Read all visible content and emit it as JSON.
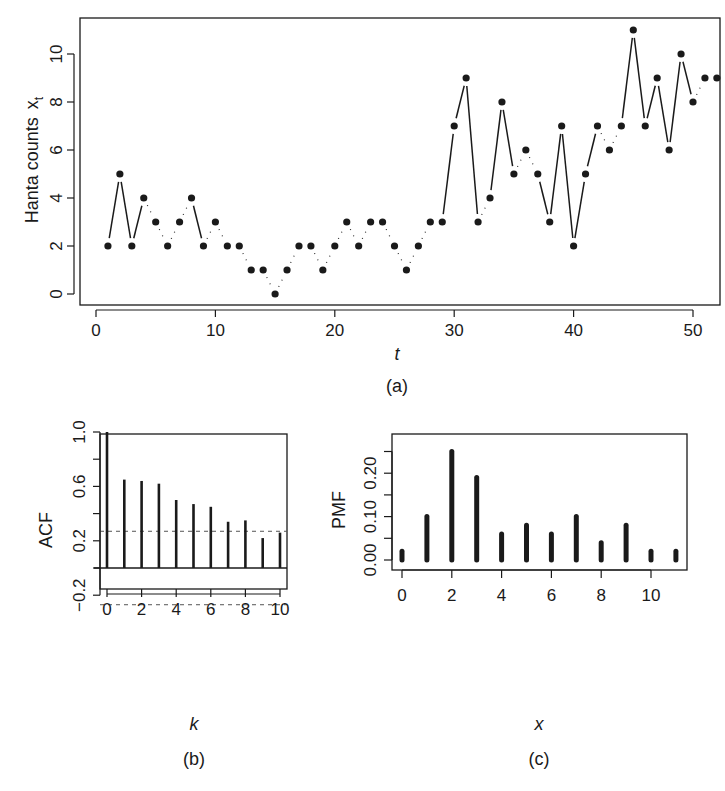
{
  "chart_data": [
    {
      "id": "a",
      "type": "line",
      "caption": "(a)",
      "title": "",
      "xlabel": "t",
      "ylabel": "Hanta counts",
      "ylabel_symbol": "x",
      "ylabel_subscript": "t",
      "xlim": [
        0,
        52
      ],
      "ylim": [
        0,
        11
      ],
      "x_ticks": [
        0,
        10,
        20,
        30,
        40,
        50
      ],
      "y_ticks": [
        0,
        2,
        4,
        6,
        8,
        10
      ],
      "grid": false,
      "markers": "filled-circle",
      "line_style": "segments between points (solid for large jumps, dotted for small)",
      "x": [
        1,
        2,
        3,
        4,
        5,
        6,
        7,
        8,
        9,
        10,
        11,
        12,
        13,
        14,
        15,
        16,
        17,
        18,
        19,
        20,
        21,
        22,
        23,
        24,
        25,
        26,
        27,
        28,
        29,
        30,
        31,
        32,
        33,
        34,
        35,
        36,
        37,
        38,
        39,
        40,
        41,
        42,
        43,
        44,
        45,
        46,
        47,
        48,
        49,
        50,
        51,
        52
      ],
      "values": [
        2,
        5,
        2,
        4,
        3,
        2,
        3,
        4,
        2,
        3,
        2,
        2,
        1,
        1,
        0,
        1,
        2,
        2,
        1,
        2,
        3,
        2,
        3,
        3,
        2,
        1,
        2,
        3,
        3,
        7,
        9,
        3,
        4,
        8,
        5,
        6,
        5,
        3,
        7,
        2,
        5,
        7,
        6,
        7,
        11,
        7,
        9,
        6,
        10,
        8,
        9,
        9
      ]
    },
    {
      "id": "b",
      "type": "bar",
      "style": "stem",
      "caption": "(b)",
      "title": "",
      "xlabel": "k",
      "ylabel": "ACF",
      "xlim": [
        0,
        10
      ],
      "ylim": [
        -0.33,
        1.05
      ],
      "x_ticks": [
        0,
        2,
        4,
        6,
        8,
        10
      ],
      "y_ticks": [
        -0.2,
        0.2,
        0.6,
        1.0
      ],
      "y_minor_ticks": [
        0.0,
        0.4,
        0.8
      ],
      "grid": false,
      "categories": [
        0,
        1,
        2,
        3,
        4,
        5,
        6,
        7,
        8,
        9,
        10
      ],
      "values": [
        1.0,
        0.65,
        0.64,
        0.62,
        0.5,
        0.47,
        0.45,
        0.34,
        0.35,
        0.22,
        0.26
      ],
      "confidence_bounds": [
        -0.27,
        0.27
      ],
      "confidence_line_style": "dashed"
    },
    {
      "id": "c",
      "type": "bar",
      "style": "stem",
      "caption": "(c)",
      "title": "",
      "xlabel": "x",
      "ylabel": "PMF",
      "xlim": [
        0,
        11
      ],
      "ylim": [
        0,
        0.25
      ],
      "x_ticks": [
        0,
        2,
        4,
        6,
        8,
        10
      ],
      "y_ticks": [
        0.0,
        0.1,
        0.2
      ],
      "y_minor_ticks": [
        0.05,
        0.15,
        0.25
      ],
      "grid": false,
      "categories": [
        0,
        1,
        2,
        3,
        4,
        5,
        6,
        7,
        8,
        9,
        10,
        11
      ],
      "values": [
        0.02,
        0.1,
        0.25,
        0.19,
        0.06,
        0.08,
        0.06,
        0.1,
        0.04,
        0.08,
        0.02,
        0.02
      ]
    }
  ],
  "labels": {
    "a": {
      "caption": "(a)",
      "xlabel": "t",
      "ylabel": "Hanta counts",
      "ylabel_symbol": "x",
      "ylabel_sub": "t",
      "x_ticks": [
        "0",
        "10",
        "20",
        "30",
        "40",
        "50"
      ],
      "y_ticks": [
        "0",
        "2",
        "4",
        "6",
        "8",
        "10"
      ]
    },
    "b": {
      "caption": "(b)",
      "xlabel": "k",
      "ylabel": "ACF",
      "x_ticks": [
        "0",
        "2",
        "4",
        "6",
        "8",
        "10"
      ],
      "y_ticks": [
        "−0.2",
        "0.2",
        "0.6",
        "1.0"
      ]
    },
    "c": {
      "caption": "(c)",
      "xlabel": "x",
      "ylabel": "PMF",
      "x_ticks": [
        "0",
        "2",
        "4",
        "6",
        "8",
        "10"
      ],
      "y_ticks": [
        "0.00",
        "0.10",
        "0.20"
      ]
    }
  },
  "colors": {
    "ink": "#1a1a1a",
    "dashed": "#555555",
    "background": "#ffffff"
  }
}
